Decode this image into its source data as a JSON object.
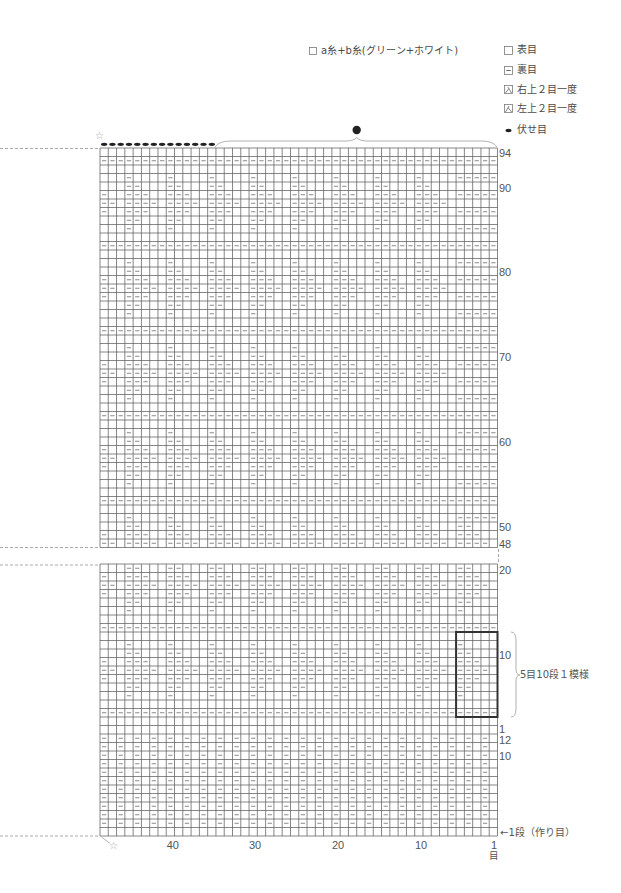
{
  "legend": {
    "yarn": {
      "label": "a糸+b糸(グリーン+ホワイト)"
    },
    "symbols": [
      {
        "key": "knit",
        "label": "表目"
      },
      {
        "key": "purl",
        "label": "裏目"
      },
      {
        "key": "right-over-k2tog",
        "label": "右上２目一度"
      },
      {
        "key": "left-over-k2tog",
        "label": "左上２目一度"
      },
      {
        "key": "bind-off",
        "label": "伏せ目"
      }
    ]
  },
  "chart": {
    "stitch_count": 48,
    "symbols": {
      "-": "purl",
      ".": "knit"
    },
    "row_patterns": {
      "E": [
        [
          ".",
          48
        ]
      ],
      "A": [
        [
          "-",
          48
        ]
      ],
      "W1": [
        [
          "...-.",
          9
        ],
        [
          "...",
          1
        ]
      ],
      "W2": [
        [
          "...--",
          9
        ],
        [
          "...",
          1
        ]
      ],
      "W3": [
        [
          "-..--",
          9
        ],
        [
          "-..",
          1
        ]
      ],
      "W4": [
        [
          "--.--",
          9
        ],
        [
          "--.",
          1
        ]
      ],
      "W1B": [
        [
          "...-.",
          8
        ],
        [
          "...--",
          1
        ],
        [
          "---",
          1
        ]
      ],
      "W2B": [
        [
          "...--",
          8
        ],
        [
          ".....",
          1
        ],
        [
          "...",
          1
        ]
      ],
      "W3B": [
        [
          "-..--",
          9
        ],
        [
          "---",
          1
        ]
      ],
      "W4B": [
        [
          "--.--",
          8
        ],
        [
          "--...",
          1
        ],
        [
          "...",
          1
        ]
      ],
      "RIB": [
        [
          "-.",
          24
        ]
      ]
    },
    "upper_section": {
      "first_row": 94,
      "last_row": 48,
      "rows": [
        "E",
        "A",
        "E",
        "W1B",
        "W2B",
        "W3B",
        "W4B",
        "W3B",
        "W2B",
        "W1B",
        "E",
        "A",
        "E",
        "W1B",
        "W2B",
        "W3B",
        "W4B",
        "W3B",
        "W2B",
        "W1B",
        "E",
        "A",
        "E",
        "W1B",
        "W2B",
        "W3B",
        "W4B",
        "W3B",
        "W2B",
        "W1B",
        "E",
        "A",
        "E",
        "W1B",
        "W2B",
        "W3B",
        "W4B",
        "W3B",
        "W2B",
        "W1B",
        "E",
        "A",
        "E",
        "W1B",
        "W2",
        "W3",
        "W4"
      ],
      "row_labels": [
        {
          "row": 94,
          "text": "94"
        },
        {
          "row": 90,
          "text": "90"
        },
        {
          "row": 80,
          "text": "80"
        },
        {
          "row": 70,
          "text": "70"
        },
        {
          "row": 60,
          "text": "60"
        },
        {
          "row": 50,
          "text": "50"
        },
        {
          "row": 48,
          "text": "48"
        }
      ]
    },
    "lower_section": {
      "first_row": 20,
      "last_row": 1,
      "rows": [
        "W2",
        "W3",
        "W4",
        "W3",
        "W2",
        "W1",
        "E",
        "A",
        "E",
        "W1",
        "W2",
        "W3",
        "W4",
        "W3",
        "W2",
        "W1",
        "E",
        "A",
        "E",
        "E"
      ],
      "row_labels": [
        {
          "row": 20,
          "text": "20"
        },
        {
          "row": 10,
          "text": "10"
        },
        {
          "row": 1,
          "text": "1"
        }
      ]
    },
    "rib_section": {
      "first_row": 12,
      "last_row": 1,
      "rows": [
        "RIB",
        "RIB",
        "RIB",
        "RIB",
        "RIB",
        "RIB",
        "RIB",
        "RIB",
        "RIB",
        "RIB",
        "RIB",
        "E"
      ],
      "row_labels": [
        {
          "row": 12,
          "text": "12"
        },
        {
          "row": 10,
          "text": "10"
        }
      ],
      "cast_on_label": "←1段（作り目）"
    },
    "bind_off": {
      "stitch_count": 14,
      "remaining_marker": "●"
    },
    "repeat_box": {
      "label": "5目10段１模様",
      "stitches": 5,
      "rows": 10,
      "from_stitch": 1,
      "to_stitch": 5,
      "from_row": 3,
      "to_row": 12
    },
    "x_axis": {
      "labels": [
        {
          "stitch": 40,
          "text": "40"
        },
        {
          "stitch": 30,
          "text": "30"
        },
        {
          "stitch": 20,
          "text": "20"
        },
        {
          "stitch": 10,
          "text": "10"
        },
        {
          "stitch": 1,
          "text": "1"
        }
      ],
      "unit": "目"
    },
    "markers": {
      "star": "☆"
    },
    "colors": {
      "grid_line": "#5f5f5f",
      "purl_mark": "#8a8a8a",
      "guide_line": "#a0a0a0",
      "repeat_box": "#333333",
      "bind_off": "#222222"
    }
  }
}
